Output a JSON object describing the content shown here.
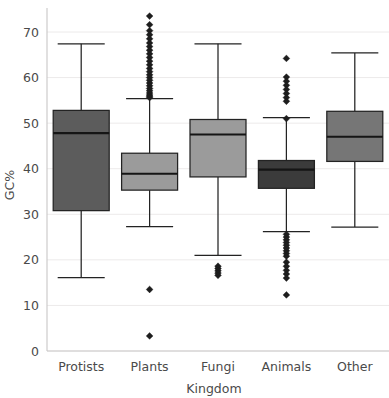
{
  "chart_data": {
    "type": "box",
    "title": "",
    "xlabel": "Kingdom",
    "ylabel": "GC%",
    "categories": [
      "Protists",
      "Plants",
      "Fungi",
      "Animals",
      "Other"
    ],
    "ylim": [
      0,
      75.5
    ],
    "yticks": [
      0,
      10,
      20,
      30,
      40,
      50,
      60,
      70
    ],
    "ytick_labels": [
      "0",
      "10",
      "20",
      "30",
      "40",
      "50",
      "60",
      "70"
    ],
    "grid": true,
    "grid_axis": "y",
    "legend": "none",
    "boxes": [
      {
        "category": "Protists",
        "whisker_low": 16.1,
        "q1": 30.8,
        "median": 47.8,
        "q3": 52.8,
        "whisker_high": 67.4,
        "fill": "#5c5c5c",
        "outliers": []
      },
      {
        "category": "Plants",
        "whisker_low": 27.3,
        "q1": 35.3,
        "median": 38.9,
        "q3": 43.4,
        "whisker_high": 55.4,
        "fill": "#9b9b9b",
        "outliers": [
          73.5,
          71.6,
          70.3,
          69.4,
          68.5,
          67.6,
          66.8,
          66.0,
          65.2,
          64.4,
          63.6,
          62.8,
          62.0,
          61.3,
          60.6,
          60.0,
          59.4,
          58.8,
          58.2,
          57.6,
          57.1,
          56.6,
          56.2,
          55.9,
          55.6,
          13.5,
          3.3
        ]
      },
      {
        "category": "Fungi",
        "whisker_low": 21.0,
        "q1": 38.2,
        "median": 47.5,
        "q3": 50.8,
        "whisker_high": 67.4,
        "fill": "#9b9b9b",
        "outliers": [
          18.6,
          18.1,
          17.6,
          17.1,
          16.6
        ]
      },
      {
        "category": "Animals",
        "whisker_low": 26.2,
        "q1": 35.7,
        "median": 39.8,
        "q3": 41.8,
        "whisker_high": 51.2,
        "fill": "#3b3b3b",
        "outliers": [
          64.2,
          60.1,
          59.2,
          58.3,
          57.4,
          56.5,
          55.6,
          54.8,
          51.0,
          25.6,
          25.0,
          24.4,
          23.8,
          23.2,
          22.6,
          22.0,
          21.4,
          20.8,
          19.5,
          18.6,
          17.7,
          16.9,
          16.0,
          12.3
        ]
      },
      {
        "category": "Other",
        "whisker_low": 27.2,
        "q1": 41.6,
        "median": 47.0,
        "q3": 52.6,
        "whisker_high": 65.4,
        "fill": "#767676",
        "outliers": []
      }
    ]
  },
  "colors": {
    "grid": "#eceaea",
    "spine": "#c9c7c7",
    "line": "#232323",
    "text": "#4a4a4a",
    "outlier": "#1d1d1d",
    "background": "#ffffff"
  }
}
